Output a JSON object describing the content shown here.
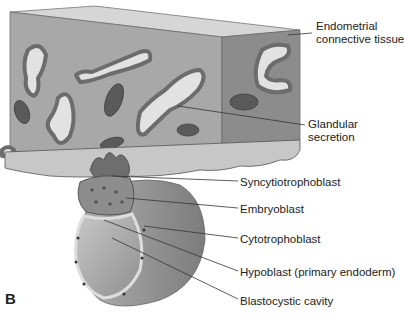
{
  "figure": {
    "panel_letter": "B",
    "labels": [
      {
        "id": "endometrial",
        "line1": "Endometrial",
        "line2": "connective tissue"
      },
      {
        "id": "glandular",
        "line1": "Glandular",
        "line2": "secretion"
      },
      {
        "id": "syncytio",
        "line1": "Syncytiotrophoblast"
      },
      {
        "id": "embryoblast",
        "line1": "Embryoblast"
      },
      {
        "id": "cytotropho",
        "line1": "Cytotrophoblast"
      },
      {
        "id": "hypoblast",
        "line1": "Hypoblast (primary endoderm)"
      },
      {
        "id": "blastocystic",
        "line1": "Blastocystic cavity"
      }
    ],
    "colors": {
      "tissue_front": "#a9a9a9",
      "tissue_side": "#8a8a8a",
      "tissue_top": "#d4d4d4",
      "gland_wall": "#7a7a7a",
      "gland_lumen": "#e3e3e3",
      "vessel": "#5e5e5e",
      "blastocyst_outer": "#9a9a9a",
      "cavity": "#b8b8b8",
      "leader_line": "#333333"
    }
  }
}
